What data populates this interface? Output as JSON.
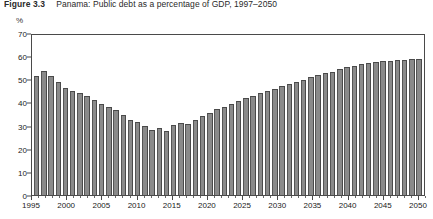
{
  "figure": {
    "number": "Figure 3.3",
    "title": "Panama: Public debt as a percentage of GDP, 1997–2050",
    "unit_label": "%"
  },
  "chart_data": {
    "type": "bar",
    "title": "Panama: Public debt as a percentage of GDP, 1997–2050",
    "xlabel": "",
    "ylabel": "%",
    "ylim": [
      0,
      70
    ],
    "ytick_values": [
      0,
      10,
      20,
      30,
      40,
      50,
      60,
      70
    ],
    "ytick_labels": [
      "0",
      "10",
      "20",
      "30",
      "40",
      "50",
      "60",
      "70"
    ],
    "xlim": [
      1995,
      2051
    ],
    "xtick_values": [
      1995,
      2000,
      2005,
      2010,
      2015,
      2020,
      2025,
      2030,
      2035,
      2040,
      2045,
      2050
    ],
    "xtick_labels": [
      "1995",
      "2000",
      "2005",
      "2010",
      "2015",
      "2020",
      "2025",
      "2030",
      "2035",
      "2040",
      "2045",
      "2050"
    ],
    "grid": false,
    "legend": null,
    "bar_color": "#8a8a8a",
    "bar_edge_color": "#4a4a4a",
    "categories": [
      "1997",
      "1998",
      "1999",
      "2000",
      "2001",
      "2002",
      "2003",
      "2004",
      "2005",
      "2006",
      "2007",
      "2008",
      "2009",
      "2010",
      "2011",
      "2012",
      "2013",
      "2014",
      "2015",
      "2016",
      "2017",
      "2018",
      "2019",
      "2020",
      "2021",
      "2022",
      "2023",
      "2024",
      "2025",
      "2026",
      "2027",
      "2028",
      "2029",
      "2030",
      "2031",
      "2032",
      "2033",
      "2034",
      "2035",
      "2036",
      "2037",
      "2038",
      "2039",
      "2040",
      "2041",
      "2042",
      "2043",
      "2044",
      "2045",
      "2046",
      "2047",
      "2048",
      "2049",
      "2050"
    ],
    "values": [
      52.0,
      54.2,
      52.0,
      49.5,
      47.0,
      45.5,
      44.5,
      43.5,
      41.5,
      40.0,
      38.5,
      37.0,
      35.0,
      33.0,
      32.0,
      30.0,
      28.5,
      29.5,
      28.0,
      30.5,
      31.5,
      31.0,
      33.0,
      34.5,
      36.0,
      37.5,
      38.5,
      40.0,
      41.0,
      42.5,
      43.5,
      44.5,
      45.5,
      46.5,
      47.5,
      48.5,
      49.5,
      50.5,
      51.5,
      52.5,
      53.5,
      54.0,
      55.0,
      55.8,
      56.5,
      57.2,
      57.8,
      58.2,
      58.5,
      58.8,
      59.0,
      59.2,
      59.4,
      59.6
    ]
  }
}
